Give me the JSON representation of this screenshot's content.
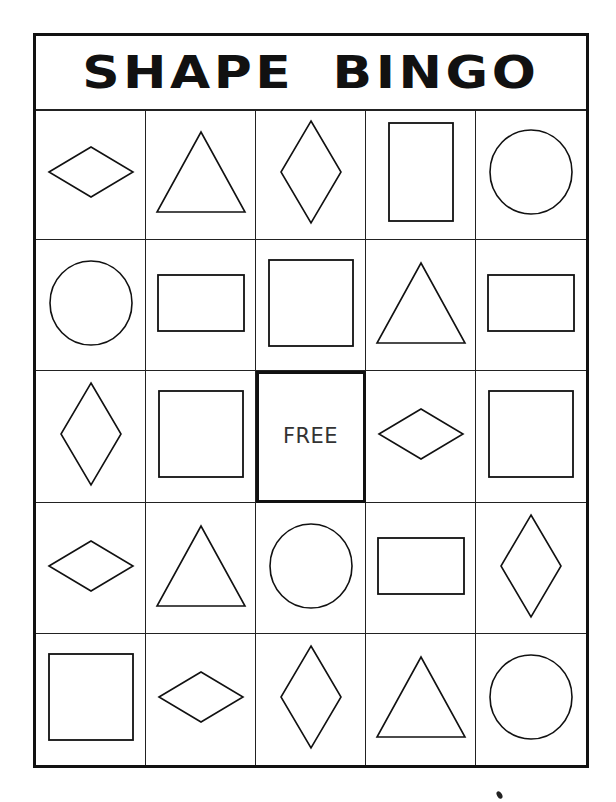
{
  "title": "SHAPE BINGO",
  "free_label": "FREE",
  "colors": {
    "ink": "#111111",
    "paper": "#ffffff"
  },
  "grid": [
    [
      "diamond-wide",
      "triangle",
      "diamond-tall",
      "rectangle-tall",
      "circle"
    ],
    [
      "circle",
      "rectangle-wide",
      "square",
      "triangle",
      "rectangle-wide"
    ],
    [
      "diamond-tall",
      "square",
      "free",
      "diamond-wide",
      "square"
    ],
    [
      "diamond-wide",
      "triangle",
      "circle",
      "rectangle-wide",
      "diamond-tall"
    ],
    [
      "square",
      "diamond-wide",
      "diamond-tall",
      "triangle",
      "circle"
    ]
  ]
}
